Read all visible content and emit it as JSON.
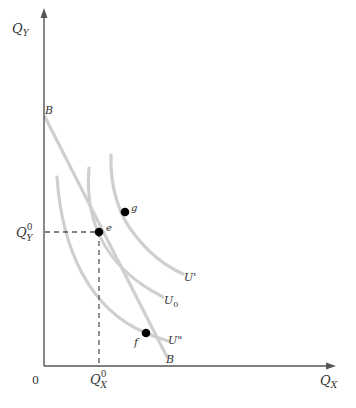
{
  "diagram": {
    "type": "indifference-curve-budget-line",
    "axes": {
      "x_label": "Q",
      "x_label_sub": "X",
      "y_label": "Q",
      "y_label_sub": "Y",
      "origin_label": "0",
      "x_tick_label": "Q",
      "x_tick_sub": "X",
      "x_tick_sup": "0",
      "y_tick_label": "Q",
      "y_tick_sub": "Y",
      "y_tick_sup": "0"
    },
    "budget_line": {
      "top_label": "B",
      "bottom_label": "B"
    },
    "curves": [
      {
        "id": "U_prime",
        "label": "U'"
      },
      {
        "id": "U0",
        "label": "U",
        "label_sub": "0"
      },
      {
        "id": "U_double_prime",
        "label": "U\""
      }
    ],
    "points": [
      {
        "id": "e",
        "label": "e"
      },
      {
        "id": "g",
        "label": "g"
      },
      {
        "id": "f",
        "label": "f"
      }
    ],
    "colors": {
      "axis": "#555555",
      "curve": "#cccccc",
      "point": "#000000",
      "dash": "#555555"
    }
  }
}
